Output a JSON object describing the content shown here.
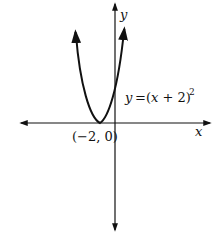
{
  "chart_data": {
    "type": "line",
    "title": "",
    "function": "y = (x + 2)^2",
    "equation_label": {
      "y": "y",
      "eq": "=",
      "body": "(x + 2)",
      "exp": "2"
    },
    "xlabel": "x",
    "ylabel": "y",
    "annotations": [
      {
        "text": "(−2, 0)",
        "point": [
          -2,
          0
        ],
        "meaning": "vertex"
      }
    ],
    "series": [
      {
        "name": "y = (x + 2)^2",
        "x": [
          -4.2,
          -4,
          -3.5,
          -3,
          -2.5,
          -2,
          -1.5,
          -1,
          -0.5,
          0,
          0.2
        ],
        "y": [
          4.84,
          4,
          2.25,
          1,
          0.25,
          0,
          0.25,
          1,
          2.25,
          4,
          4.84
        ]
      }
    ],
    "grid": false,
    "ticks": false,
    "axes_arrows": true,
    "legend": null
  },
  "labels": {
    "x_axis": "x",
    "y_axis": "y",
    "vertex": "(−2, 0)",
    "eq_y": "y",
    "eq_equals": "=",
    "eq_body": "(x + 2)",
    "eq_exp": "2"
  },
  "colors": {
    "ink": "#111111",
    "background": "#ffffff"
  }
}
